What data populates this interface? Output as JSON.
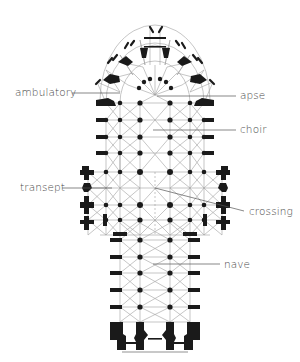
{
  "diagram": {
    "colors": {
      "background": "#ffffff",
      "structure": "#1a1a1a",
      "vault_lines": "#9a9a9a",
      "leader_lines": "#555555",
      "label_text": "#4a4a4a",
      "threshold": "#c8c8c8"
    },
    "labels": [
      {
        "id": "ambulatory",
        "text": "ambulatory",
        "x": 15,
        "y": 86,
        "side": "left"
      },
      {
        "id": "apse",
        "text": "apse",
        "x": 240,
        "y": 89,
        "side": "right"
      },
      {
        "id": "choir",
        "text": "choir",
        "x": 240,
        "y": 124,
        "side": "right"
      },
      {
        "id": "transept",
        "text": "transept",
        "x": 20,
        "y": 181,
        "side": "left"
      },
      {
        "id": "crossing",
        "text": "crossing",
        "x": 249,
        "y": 206,
        "side": "right"
      },
      {
        "id": "nave",
        "text": "nave",
        "x": 224,
        "y": 259,
        "side": "right"
      }
    ]
  }
}
